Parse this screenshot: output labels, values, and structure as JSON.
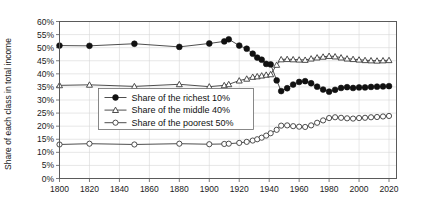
{
  "chart_data": {
    "type": "line",
    "title": "",
    "xlabel": "",
    "ylabel": "Share of each class in total income",
    "xlim": [
      1800,
      2025
    ],
    "ylim": [
      0,
      60
    ],
    "grid": true,
    "legend_position": "center-left",
    "xticks": [
      1800,
      1820,
      1840,
      1860,
      1880,
      1900,
      1920,
      1940,
      1960,
      1980,
      2000,
      2020
    ],
    "xtick_labels": [
      "1800",
      "1820",
      "1840",
      "1860",
      "1880",
      "1900",
      "1920",
      "1940",
      "1960",
      "1980",
      "2000",
      "2020"
    ],
    "yticks": [
      0,
      5,
      10,
      15,
      20,
      25,
      30,
      35,
      40,
      45,
      50,
      55,
      60
    ],
    "ytick_labels": [
      "0%",
      "5%",
      "10%",
      "15%",
      "20%",
      "25%",
      "30%",
      "35%",
      "40%",
      "45%",
      "50%",
      "55%",
      "60%"
    ],
    "series": [
      {
        "name": "Share of the richest 10%",
        "marker": "filled-circle",
        "x": [
          1800,
          1820,
          1850,
          1880,
          1900,
          1910,
          1913,
          1920,
          1925,
          1929,
          1932,
          1935,
          1938,
          1941,
          1945,
          1948,
          1952,
          1956,
          1960,
          1964,
          1968,
          1972,
          1976,
          1980,
          1984,
          1988,
          1992,
          1996,
          2000,
          2004,
          2008,
          2012,
          2016,
          2020
        ],
        "values": [
          50.8,
          50.7,
          51.5,
          50.3,
          51.6,
          52.4,
          53.2,
          50.8,
          49.6,
          47.7,
          46.2,
          45.4,
          43.8,
          43.6,
          37.5,
          33.4,
          34.5,
          35.9,
          36.9,
          37.2,
          36.4,
          35.1,
          34.0,
          33.2,
          33.9,
          34.6,
          34.9,
          34.6,
          34.8,
          34.8,
          35.0,
          35.1,
          35.2,
          35.3
        ]
      },
      {
        "name": "Share of the middle 40%",
        "marker": "open-triangle",
        "x": [
          1800,
          1820,
          1850,
          1880,
          1900,
          1910,
          1913,
          1920,
          1925,
          1929,
          1932,
          1935,
          1938,
          1941,
          1945,
          1948,
          1952,
          1956,
          1960,
          1964,
          1968,
          1972,
          1976,
          1980,
          1984,
          1988,
          1992,
          1996,
          2000,
          2004,
          2008,
          2012,
          2016,
          2020
        ],
        "values": [
          35.6,
          35.8,
          35.2,
          36.0,
          35.1,
          35.6,
          36.0,
          37.4,
          38.1,
          38.8,
          39.0,
          39.3,
          39.6,
          39.8,
          43.4,
          45.5,
          45.6,
          45.5,
          45.4,
          45.3,
          45.8,
          46.2,
          46.5,
          46.8,
          46.6,
          46.2,
          45.8,
          45.6,
          45.4,
          45.2,
          45.1,
          45.0,
          45.1,
          45.2
        ]
      },
      {
        "name": "Share of the poorest 50%",
        "marker": "open-circle",
        "x": [
          1800,
          1820,
          1850,
          1880,
          1900,
          1910,
          1913,
          1920,
          1925,
          1929,
          1932,
          1935,
          1938,
          1941,
          1945,
          1948,
          1952,
          1956,
          1960,
          1964,
          1968,
          1972,
          1976,
          1980,
          1984,
          1988,
          1992,
          1996,
          2000,
          2004,
          2008,
          2012,
          2016,
          2020
        ],
        "values": [
          13.0,
          13.3,
          13.0,
          13.3,
          13.1,
          13.2,
          13.3,
          13.6,
          14.0,
          14.5,
          15.0,
          15.6,
          16.4,
          17.3,
          18.6,
          20.2,
          20.3,
          20.0,
          19.8,
          19.7,
          20.3,
          21.3,
          22.2,
          23.1,
          23.4,
          23.2,
          23.0,
          22.9,
          23.1,
          23.2,
          23.4,
          23.5,
          23.7,
          23.9
        ]
      }
    ]
  },
  "legend": {
    "items": [
      {
        "label": "Share of the richest 10%",
        "marker": "filled-circle"
      },
      {
        "label": "Share of the middle 40%",
        "marker": "open-triangle"
      },
      {
        "label": "Share of the poorest 50%",
        "marker": "open-circle"
      }
    ]
  },
  "colors": {
    "line": "#3a3a3a",
    "marker_fill_dark": "#111111",
    "marker_open": "#ffffff",
    "grid": "#d7d7d7",
    "frame": "#5a5a5a",
    "text": "#1a1a1a",
    "background": "#ffffff"
  }
}
